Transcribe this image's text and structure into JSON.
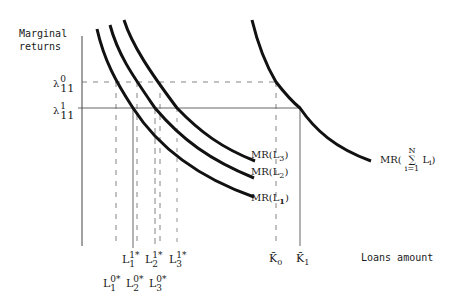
{
  "axes": {
    "y_label_line1": "Marginal",
    "y_label_line2": "returns",
    "x_label": "Loans amount"
  },
  "y_ticks": [
    {
      "base": "λ",
      "sup": "0",
      "sub": "11"
    },
    {
      "base": "λ",
      "sup": "1",
      "sub": "11"
    }
  ],
  "curves": [
    {
      "label_base": "MR(L",
      "label_sub": "1",
      "label_end": ")"
    },
    {
      "label_base": "MR(L",
      "label_sub": "2",
      "label_end": ")"
    },
    {
      "label_base": "MR(L",
      "label_sub": "3",
      "label_end": ")"
    }
  ],
  "aggregate_curve": {
    "label_prefix": "MR(",
    "sum_top": "N",
    "sum_symbol": "∑",
    "sum_bottom": "i=1",
    "term": "L",
    "term_sub": "i",
    "label_end": ")"
  },
  "x_ticks_row1": [
    {
      "base": "L",
      "sup": "1",
      "sub": "1",
      "star": "*"
    },
    {
      "base": "L",
      "sup": "1",
      "sub": "2",
      "star": "*"
    },
    {
      "base": "L",
      "sup": "1",
      "sub": "3",
      "star": "*"
    }
  ],
  "x_ticks_row2": [
    {
      "base": "L",
      "sup": "0",
      "sub": "1",
      "star": "*"
    },
    {
      "base": "L",
      "sup": "0",
      "sub": "2",
      "star": "*"
    },
    {
      "base": "L",
      "sup": "0",
      "sub": "3",
      "star": "*"
    }
  ],
  "k_ticks": [
    {
      "base": "K̄",
      "sub": "0"
    },
    {
      "base": "K̄",
      "sub": "1"
    }
  ],
  "colors": {
    "ink": "#111111",
    "guide": "#555555",
    "background": "#ffffff"
  }
}
